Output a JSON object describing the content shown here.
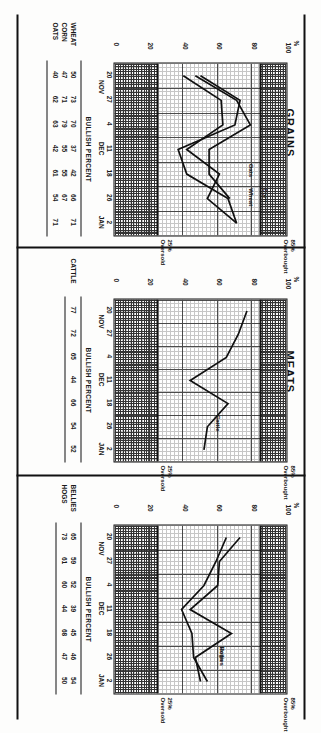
{
  "page": {
    "orientation": "rotated-90-clockwise",
    "sections": [
      "MEATS",
      "GRAINS"
    ]
  },
  "sections": [
    {
      "id": "meats",
      "title": "MEATS"
    },
    {
      "id": "grains",
      "title": "GRAINS"
    }
  ],
  "axis": {
    "y_unit_label": "%",
    "y_ticks": [
      "100",
      "80",
      "60",
      "40",
      "20",
      "0"
    ],
    "x_ticks": [
      "20",
      "27",
      "4",
      "11",
      "18",
      "26",
      "2"
    ],
    "x_months": [
      "NOV",
      "DEC",
      "JAN"
    ],
    "overbought_label": "Overbought",
    "overbought_value": "85%",
    "oversold_label": "Oversold",
    "oversold_value": "25%",
    "table_title": "BULLISH PERCENT"
  },
  "panels": [
    {
      "id": "bellies-hogs",
      "section": "MEATS",
      "series_tags": [
        "Bellies",
        "Hogs"
      ],
      "table_rows": [
        {
          "name": "BELLIES",
          "values": [
            "65",
            "59",
            "52",
            "39",
            "45",
            "46",
            "54"
          ]
        },
        {
          "name": "HOGS",
          "values": [
            "73",
            "61",
            "60",
            "44",
            "68",
            "47",
            "50"
          ]
        }
      ]
    },
    {
      "id": "cattle",
      "section": "MEATS",
      "series_tags": [
        "Cattle"
      ],
      "table_rows": [
        {
          "name": "CATTLE",
          "values": [
            "77",
            "72",
            "65",
            "44",
            "66",
            "54",
            "52"
          ]
        }
      ]
    },
    {
      "id": "grains",
      "section": "GRAINS",
      "series_tags": [
        "Wheat",
        "Oats",
        "Corn"
      ],
      "table_rows": [
        {
          "name": "WHEAT",
          "values": [
            "50",
            "73",
            "70",
            "37",
            "42",
            "66",
            "71"
          ]
        },
        {
          "name": "CORN",
          "values": [
            "47",
            "71",
            "79",
            "55",
            "55",
            "67",
            ""
          ]
        },
        {
          "name": "OATS",
          "values": [
            "40",
            "62",
            "63",
            "42",
            "61",
            "54",
            "71"
          ]
        }
      ]
    }
  ],
  "chart_data": [
    {
      "type": "line",
      "title": "MEATS — Bellies / Hogs",
      "xlabel": "",
      "ylabel": "%",
      "ylim": [
        0,
        100
      ],
      "grid": true,
      "legend": "inline-labels",
      "x": [
        "20 NOV",
        "27 NOV",
        "4 DEC",
        "11 DEC",
        "18 DEC",
        "26 DEC",
        "2 JAN"
      ],
      "bands": [
        {
          "name": "Overbought",
          "from": 85,
          "to": 100
        },
        {
          "name": "Oversold",
          "from": 0,
          "to": 25
        }
      ],
      "series": [
        {
          "name": "Bellies",
          "values": [
            65,
            59,
            52,
            39,
            45,
            46,
            54
          ]
        },
        {
          "name": "Hogs",
          "values": [
            73,
            61,
            60,
            44,
            68,
            47,
            50
          ]
        }
      ]
    },
    {
      "type": "line",
      "title": "MEATS — Cattle",
      "xlabel": "",
      "ylabel": "%",
      "ylim": [
        0,
        100
      ],
      "grid": true,
      "legend": "inline-labels",
      "x": [
        "20 NOV",
        "27 NOV",
        "4 DEC",
        "11 DEC",
        "18 DEC",
        "26 DEC",
        "2 JAN"
      ],
      "bands": [
        {
          "name": "Overbought",
          "from": 85,
          "to": 100
        },
        {
          "name": "Oversold",
          "from": 0,
          "to": 25
        }
      ],
      "series": [
        {
          "name": "Cattle",
          "values": [
            77,
            72,
            65,
            44,
            66,
            54,
            52
          ]
        }
      ]
    },
    {
      "type": "line",
      "title": "GRAINS — Wheat / Corn / Oats",
      "xlabel": "",
      "ylabel": "%",
      "ylim": [
        0,
        100
      ],
      "grid": true,
      "legend": "inline-labels",
      "x": [
        "20 NOV",
        "27 NOV",
        "4 DEC",
        "11 DEC",
        "18 DEC",
        "26 DEC",
        "2 JAN"
      ],
      "bands": [
        {
          "name": "Overbought",
          "from": 85,
          "to": 100
        },
        {
          "name": "Oversold",
          "from": 0,
          "to": 25
        }
      ],
      "series": [
        {
          "name": "Wheat",
          "values": [
            50,
            73,
            70,
            37,
            42,
            66,
            71
          ]
        },
        {
          "name": "Corn",
          "values": [
            47,
            71,
            79,
            55,
            55,
            67,
            null
          ]
        },
        {
          "name": "Oats",
          "values": [
            40,
            62,
            63,
            42,
            61,
            54,
            71
          ]
        }
      ]
    }
  ],
  "colors": {
    "ink": "#111111",
    "paper": "#fdfdfc",
    "grid": "#9a9a9a",
    "grid_major": "#3a3a3a"
  }
}
